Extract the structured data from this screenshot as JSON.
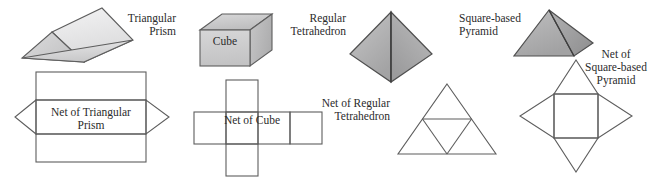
{
  "figure": {
    "background_color": "#ffffff",
    "stroke_color": "#5a5a5a",
    "text_color": "#2b2b2b"
  },
  "solids": [
    {
      "id": "triangular-prism",
      "label": "Triangular\nPrism",
      "fill_light": "#ececed",
      "fill_mid": "#d9d9da",
      "fill_dark": "#c4c4c5"
    },
    {
      "id": "cube",
      "label": "Cube",
      "inner_label": "Cube",
      "fill_light": "#d2d2d3",
      "fill_mid": "#c0c0c1",
      "fill_dark": "#b3b3b4"
    },
    {
      "id": "regular-tetrahedron",
      "label": "Regular\nTetrahedron",
      "fill_light": "#b9b9ba",
      "fill_mid": "#a8a8a9",
      "fill_dark": "#9a9a9b"
    },
    {
      "id": "square-based-pyramid",
      "label": "Square-based\nPyramid",
      "fill_light": "#b2b2b3",
      "fill_mid": "#a0a0a1",
      "fill_dark": "#8e8e8f"
    }
  ],
  "nets": [
    {
      "id": "net-of-triangular-prism",
      "label": "Net of Triangular\nPrism",
      "description": "three stacked rectangles with a triangle flap on the left and right of the middle rectangle"
    },
    {
      "id": "net-of-cube",
      "label": "Net of Cube",
      "description": "cross of six squares: a row of four squares with one square above and one below the second square"
    },
    {
      "id": "net-of-regular-tetrahedron",
      "label": "Net of Regular\nTetrahedron",
      "description": "large equilateral triangle subdivided by midlines into four smaller triangles"
    },
    {
      "id": "net-of-square-based-pyramid",
      "label": "Net of\nSquare-based\nPyramid",
      "description": "central square with an isosceles triangle attached to each of its four sides"
    }
  ]
}
